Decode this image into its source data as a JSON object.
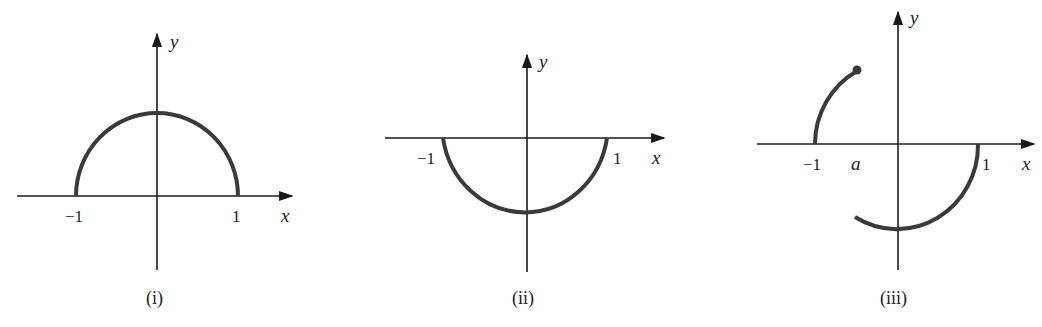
{
  "figures": [
    {
      "id": "i",
      "caption": "(i)",
      "axis_labels": {
        "x": "x",
        "y": "y"
      },
      "ticks": [
        "-1",
        "1"
      ],
      "description": "upper semicircle from x=-1 to x=1"
    },
    {
      "id": "ii",
      "caption": "(ii)",
      "axis_labels": {
        "x": "x",
        "y": "y"
      },
      "ticks": [
        "-1",
        "1"
      ],
      "description": "lower semicircle from x=-1 to x=1"
    },
    {
      "id": "iii",
      "caption": "(iii)",
      "axis_labels": {
        "x": "x",
        "y": "y"
      },
      "ticks": [
        "-1",
        "a",
        "1"
      ],
      "description": "upper arc from x=-1 to x=a with closed endpoint at a; lower arc from x=a to x=1"
    }
  ],
  "colors": {
    "axis": "#1a1a1a",
    "curve": "#3a3a3a",
    "background": "#ffffff"
  }
}
